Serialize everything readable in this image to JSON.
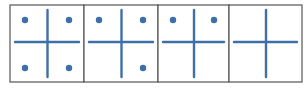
{
  "diagram": {
    "colors": {
      "shape": "#3f6fa8",
      "border": "#555555",
      "background": "#ffffff"
    },
    "panels": [
      {
        "index": 1,
        "dots": [
          "top-left",
          "top-right",
          "bottom-left",
          "bottom-right"
        ],
        "dot_count": 4
      },
      {
        "index": 2,
        "dots": [
          "top-left",
          "top-right",
          "bottom-right"
        ],
        "dot_count": 3
      },
      {
        "index": 3,
        "dots": [
          "top-left",
          "top-right"
        ],
        "dot_count": 2
      },
      {
        "index": 4,
        "dots": [],
        "dot_count": 0
      }
    ]
  }
}
